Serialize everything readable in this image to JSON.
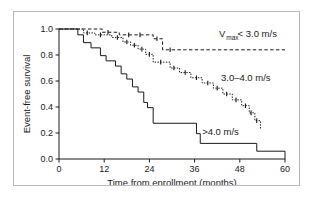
{
  "chart_data": {
    "type": "line",
    "title": "",
    "xlabel": "Time from enrollment (months)",
    "ylabel": "Event-free survival",
    "xlim": [
      0,
      60
    ],
    "ylim": [
      0,
      1.0
    ],
    "xticks": [
      "0",
      "12",
      "24",
      "36",
      "48",
      "60"
    ],
    "xtick_values": [
      0,
      12,
      24,
      36,
      48,
      60
    ],
    "yticks": [
      "0.0",
      "0.2",
      "0.4",
      "0.6",
      "0.8",
      "1.0"
    ],
    "ytick_values": [
      0.0,
      0.2,
      0.4,
      0.6,
      0.8,
      1.0
    ],
    "grid": false,
    "legend_position": "inline-annotations",
    "curve_style": "kaplan-meier-step",
    "series": [
      {
        "name": "vmax-lt-3",
        "label_text": "V",
        "label_sub": "max",
        "label_tail": " < 3.0 m/s",
        "label_full": "Vmax < 3.0 m/s",
        "linestyle": "dashed",
        "label_x": 42.5,
        "label_y": 0.935,
        "steps": [
          [
            0,
            1.0
          ],
          [
            11.5,
            1.0
          ],
          [
            11.5,
            0.975
          ],
          [
            16.0,
            0.975
          ],
          [
            16.0,
            0.955
          ],
          [
            25.0,
            0.955
          ],
          [
            25.0,
            0.925
          ],
          [
            27.5,
            0.925
          ],
          [
            27.5,
            0.84
          ],
          [
            60,
            0.84
          ]
        ],
        "censor_points": [
          [
            13.0,
            0.975
          ],
          [
            18.5,
            0.955
          ],
          [
            21.5,
            0.955
          ],
          [
            26.0,
            0.925
          ],
          [
            29.5,
            0.84
          ]
        ]
      },
      {
        "name": "vmax-3-to-4",
        "label_text": "3.0–4.0 m/s",
        "label_full": "3.0–4.0 m/s",
        "linestyle": "dotted",
        "label_x": 43.0,
        "label_y": 0.6,
        "steps": [
          [
            0,
            1.0
          ],
          [
            6.5,
            1.0
          ],
          [
            6.5,
            0.97
          ],
          [
            9.5,
            0.97
          ],
          [
            9.5,
            0.955
          ],
          [
            14.0,
            0.955
          ],
          [
            14.0,
            0.935
          ],
          [
            17.0,
            0.935
          ],
          [
            17.0,
            0.9
          ],
          [
            19.0,
            0.9
          ],
          [
            19.0,
            0.875
          ],
          [
            21.0,
            0.875
          ],
          [
            21.0,
            0.845
          ],
          [
            23.0,
            0.845
          ],
          [
            23.0,
            0.805
          ],
          [
            25.0,
            0.805
          ],
          [
            25.0,
            0.745
          ],
          [
            29.5,
            0.745
          ],
          [
            29.5,
            0.7
          ],
          [
            32.0,
            0.7
          ],
          [
            32.0,
            0.665
          ],
          [
            35.0,
            0.665
          ],
          [
            35.0,
            0.625
          ],
          [
            38.0,
            0.625
          ],
          [
            38.0,
            0.585
          ],
          [
            41.0,
            0.585
          ],
          [
            41.0,
            0.545
          ],
          [
            43.5,
            0.545
          ],
          [
            43.5,
            0.5
          ],
          [
            46.0,
            0.5
          ],
          [
            46.0,
            0.455
          ],
          [
            48.5,
            0.455
          ],
          [
            48.5,
            0.41
          ],
          [
            50.5,
            0.41
          ],
          [
            50.5,
            0.355
          ],
          [
            52.0,
            0.355
          ],
          [
            52.0,
            0.295
          ],
          [
            53.5,
            0.295
          ],
          [
            53.5,
            0.225
          ]
        ],
        "censor_points": [
          [
            7.5,
            0.97
          ],
          [
            11.0,
            0.955
          ],
          [
            15.5,
            0.935
          ],
          [
            18.0,
            0.9
          ],
          [
            20.0,
            0.875
          ],
          [
            22.0,
            0.845
          ],
          [
            24.0,
            0.805
          ],
          [
            27.0,
            0.745
          ],
          [
            30.5,
            0.7
          ],
          [
            33.5,
            0.665
          ],
          [
            36.5,
            0.625
          ],
          [
            39.5,
            0.585
          ],
          [
            42.0,
            0.545
          ],
          [
            44.5,
            0.5
          ],
          [
            47.0,
            0.455
          ],
          [
            49.5,
            0.41
          ],
          [
            51.0,
            0.355
          ],
          [
            52.5,
            0.295
          ]
        ]
      },
      {
        "name": "vmax-gt-4",
        "label_text": ">4.0 m/s",
        "label_full": ">4.0 m/s",
        "linestyle": "solid",
        "label_x": 38.0,
        "label_y": 0.185,
        "steps": [
          [
            0,
            1.0
          ],
          [
            5.0,
            1.0
          ],
          [
            5.0,
            0.955
          ],
          [
            6.5,
            0.955
          ],
          [
            6.5,
            0.895
          ],
          [
            8.5,
            0.895
          ],
          [
            8.5,
            0.855
          ],
          [
            11.0,
            0.855
          ],
          [
            11.0,
            0.795
          ],
          [
            12.5,
            0.795
          ],
          [
            12.5,
            0.755
          ],
          [
            15.0,
            0.755
          ],
          [
            15.0,
            0.715
          ],
          [
            16.5,
            0.715
          ],
          [
            16.5,
            0.655
          ],
          [
            18.0,
            0.655
          ],
          [
            18.0,
            0.615
          ],
          [
            19.5,
            0.615
          ],
          [
            19.5,
            0.555
          ],
          [
            21.0,
            0.555
          ],
          [
            21.0,
            0.515
          ],
          [
            22.5,
            0.515
          ],
          [
            22.5,
            0.435
          ],
          [
            23.5,
            0.435
          ],
          [
            23.5,
            0.395
          ],
          [
            25.0,
            0.395
          ],
          [
            25.0,
            0.275
          ],
          [
            36.5,
            0.275
          ],
          [
            36.5,
            0.195
          ],
          [
            37.5,
            0.195
          ],
          [
            37.5,
            0.12
          ],
          [
            52.5,
            0.12
          ],
          [
            52.5,
            0.06
          ],
          [
            60,
            0.06
          ],
          [
            60,
            0.0
          ]
        ],
        "censor_points": []
      }
    ]
  }
}
